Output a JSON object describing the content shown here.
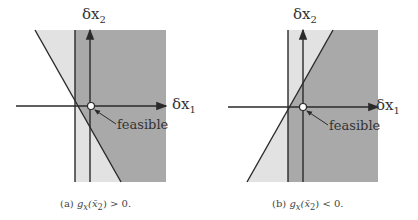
{
  "panels": [
    {
      "id": "a",
      "x_axis_label": "δx",
      "x_axis_sub": "1",
      "y_axis_label": "δx",
      "y_axis_sub": "2",
      "annotation": "feasible",
      "caption": "(a) g_x(x̄_2) > 0.",
      "caption_parts": {
        "prefix": "(a) ",
        "g": "g",
        "gsub": "x",
        "arg": "(x̄",
        "argsub": "2",
        "rest": ") > 0."
      }
    },
    {
      "id": "b",
      "x_axis_label": "δx",
      "x_axis_sub": "1",
      "y_axis_label": "δx",
      "y_axis_sub": "2",
      "annotation": "feasible",
      "caption": "(b) g_x(x̄_2) < 0.",
      "caption_parts": {
        "prefix": "(b) ",
        "g": "g",
        "gsub": "x",
        "arg": "(x̄",
        "argsub": "2",
        "rest": ") < 0."
      }
    }
  ],
  "colors": {
    "dark_region": "#a9a9a9",
    "light_region": "#e2e2e2",
    "lines": "#2a2a2a"
  }
}
